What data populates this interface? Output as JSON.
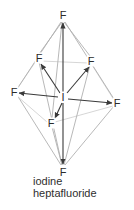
{
  "figure": {
    "title": "iodine heptafluoride",
    "caption_line1": "iodine",
    "caption_line2": "heptafluoride",
    "molecule": "IF7",
    "geometry": "pentagonal bipyramidal",
    "colors": {
      "bond_dark": "#3a3a3a",
      "edge_light": "#b4b4b4",
      "edge_faint": "#c9c9c9",
      "text": "#2b2b2b",
      "background": "#ffffff"
    },
    "atoms": [
      {
        "id": "I",
        "label": "I",
        "element": "iodine",
        "role": "center",
        "x": 63,
        "y": 97
      },
      {
        "id": "F1",
        "label": "F",
        "element": "fluorine",
        "role": "axial-top",
        "x": 63,
        "y": 15
      },
      {
        "id": "F2",
        "label": "F",
        "element": "fluorine",
        "role": "axial-bottom",
        "x": 63,
        "y": 172
      },
      {
        "id": "F3",
        "label": "F",
        "element": "fluorine",
        "role": "equatorial-upper-left",
        "x": 39,
        "y": 58
      },
      {
        "id": "F4",
        "label": "F",
        "element": "fluorine",
        "role": "equatorial-upper-right",
        "x": 91,
        "y": 61
      },
      {
        "id": "F5",
        "label": "F",
        "element": "fluorine",
        "role": "equatorial-left",
        "x": 14,
        "y": 92
      },
      {
        "id": "F6",
        "label": "F",
        "element": "fluorine",
        "role": "equatorial-right",
        "x": 117,
        "y": 103
      },
      {
        "id": "F7",
        "label": "F",
        "element": "fluorine",
        "role": "equatorial-front",
        "x": 51,
        "y": 123
      }
    ]
  }
}
